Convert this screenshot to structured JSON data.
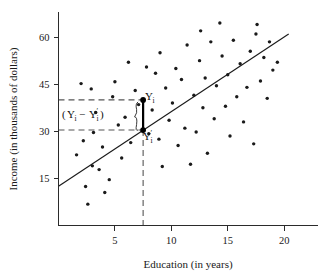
{
  "chart_data": {
    "type": "scatter",
    "title": "",
    "xlabel": "Education (in years)",
    "ylabel": "Income (in thousands of dollars)",
    "xlim": [
      0,
      23
    ],
    "ylim": [
      0,
      68
    ],
    "xticks": [
      5,
      10,
      15,
      20
    ],
    "yticks": [
      15,
      30,
      45,
      60
    ],
    "xtick_labels": [
      "5",
      "10",
      "15",
      "20"
    ],
    "ytick_labels": [
      "15",
      "30",
      "45",
      "60"
    ],
    "grid": false,
    "legend": "none",
    "series": [
      {
        "name": "observations",
        "points": [
          [
            1.6,
            22.5
          ],
          [
            2.0,
            45.2
          ],
          [
            2.2,
            27.0
          ],
          [
            2.4,
            12.4
          ],
          [
            2.6,
            6.8
          ],
          [
            2.9,
            43.5
          ],
          [
            3.0,
            19.0
          ],
          [
            3.1,
            29.6
          ],
          [
            3.3,
            36.0
          ],
          [
            3.6,
            17.8
          ],
          [
            3.9,
            25.0
          ],
          [
            4.1,
            10.5
          ],
          [
            4.5,
            14.6
          ],
          [
            4.8,
            41.0
          ],
          [
            5.0,
            45.8
          ],
          [
            5.3,
            32.0
          ],
          [
            5.6,
            21.5
          ],
          [
            5.9,
            34.5
          ],
          [
            6.2,
            52.0
          ],
          [
            6.4,
            26.4
          ],
          [
            6.8,
            43.0
          ],
          [
            7.1,
            38.5
          ],
          [
            7.5,
            40.0
          ],
          [
            7.5,
            30.4
          ],
          [
            7.8,
            50.5
          ],
          [
            8.0,
            29.2
          ],
          [
            8.3,
            36.8
          ],
          [
            8.6,
            48.5
          ],
          [
            8.9,
            27.5
          ],
          [
            9.0,
            55.0
          ],
          [
            9.2,
            18.8
          ],
          [
            9.5,
            43.8
          ],
          [
            9.8,
            33.5
          ],
          [
            10.1,
            39.0
          ],
          [
            10.4,
            50.0
          ],
          [
            10.6,
            25.5
          ],
          [
            10.9,
            46.5
          ],
          [
            11.2,
            31.0
          ],
          [
            11.4,
            57.5
          ],
          [
            11.7,
            19.5
          ],
          [
            12.0,
            41.5
          ],
          [
            12.2,
            29.8
          ],
          [
            12.5,
            52.5
          ],
          [
            12.6,
            62.0
          ],
          [
            12.8,
            37.5
          ],
          [
            13.0,
            47.0
          ],
          [
            13.2,
            23.0
          ],
          [
            13.5,
            58.5
          ],
          [
            13.8,
            34.0
          ],
          [
            14.0,
            44.5
          ],
          [
            14.3,
            64.5
          ],
          [
            14.5,
            54.0
          ],
          [
            14.8,
            38.0
          ],
          [
            15.0,
            48.0
          ],
          [
            15.2,
            28.5
          ],
          [
            15.5,
            59.0
          ],
          [
            15.8,
            41.0
          ],
          [
            16.1,
            51.5
          ],
          [
            16.4,
            33.0
          ],
          [
            16.7,
            44.0
          ],
          [
            17.0,
            55.5
          ],
          [
            17.3,
            26.0
          ],
          [
            17.5,
            61.0
          ],
          [
            17.6,
            64.0
          ],
          [
            17.9,
            46.0
          ],
          [
            18.2,
            53.5
          ],
          [
            18.5,
            40.5
          ],
          [
            18.7,
            58.5
          ],
          [
            19.0,
            49.5
          ],
          [
            19.4,
            52.0
          ]
        ]
      }
    ],
    "regression_line": {
      "label": "least-squares line",
      "x_start": 0.0,
      "y_start": 12.5,
      "x_end": 20.4,
      "y_end": 61.0
    },
    "annotations": {
      "observed_point": {
        "label": "Yi",
        "x": 7.5,
        "y": 40.0
      },
      "predicted_point": {
        "label": "Y'i",
        "x": 7.5,
        "y": 30.4
      },
      "residual_label": "( Yi − Y'i )",
      "residual_expr_open": "(",
      "residual_expr_y": "Y",
      "residual_expr_sub": "i",
      "residual_expr_minus": "−",
      "residual_expr_prime": "′",
      "residual_expr_close": ")",
      "guide_y_upper": 40.0,
      "guide_y_lower": 30.4,
      "guide_x": 7.5
    }
  }
}
